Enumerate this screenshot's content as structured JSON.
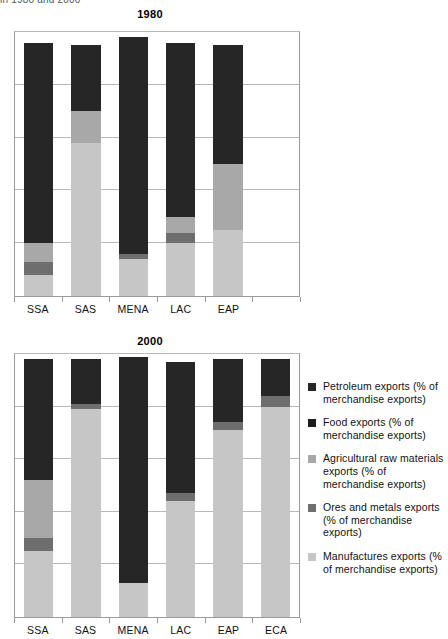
{
  "top_caption": "in 1980 and 2000",
  "colors": {
    "petroleum": "#262626",
    "food": "#1c1c1c",
    "agricultural": "#a8a8a8",
    "ores": "#6e6e6e",
    "manufactures": "#c6c6c6",
    "gridline": "#b8b8b8",
    "axis": "#9a9a9a"
  },
  "legend": {
    "items": [
      {
        "key": "petroleum",
        "swatch": "#262626",
        "label": "Petroleum exports (% of merchandise exports)"
      },
      {
        "key": "food",
        "swatch": "#1c1c1c",
        "label": "Food exports (% of merchandise exports)"
      },
      {
        "key": "agricultural",
        "swatch": "#a8a8a8",
        "label": "Agricultural raw materials exports (% of merchandise exports)"
      },
      {
        "key": "ores",
        "swatch": "#6e6e6e",
        "label": "Ores and metals exports (% of merchandise exports)"
      },
      {
        "key": "manufactures",
        "swatch": "#c6c6c6",
        "label": "Manufactures exports (% of merchandise exports)"
      }
    ]
  },
  "charts": [
    {
      "id": "chart-1980",
      "title": "1980"
    },
    {
      "id": "chart-2000",
      "title": "2000"
    }
  ],
  "chart_data": [
    {
      "type": "bar",
      "stacked": true,
      "title": "1980",
      "xlabel": "",
      "ylabel": "",
      "ylim": [
        0,
        100
      ],
      "grid": true,
      "gridlines": [
        20,
        40,
        60,
        80
      ],
      "legend_position": "right",
      "categories": [
        "SSA",
        "SAS",
        "MENA",
        "LAC",
        "EAP",
        ""
      ],
      "series": [
        {
          "name": "Manufactures exports (% of merchandise exports)",
          "values": [
            8,
            58,
            14,
            20,
            25,
            null
          ]
        },
        {
          "name": "Ores and metals exports (% of merchandise exports)",
          "values": [
            5,
            0,
            2,
            4,
            0,
            null
          ]
        },
        {
          "name": "Agricultural raw materials exports (% of merchandise exports)",
          "values": [
            7,
            12,
            0,
            6,
            25,
            null
          ]
        },
        {
          "name": "Food exports (% of merchandise exports)",
          "values": [
            0,
            0,
            0,
            0,
            0,
            null
          ]
        },
        {
          "name": "Petroleum exports (% of merchandise exports)",
          "values": [
            76,
            25,
            82,
            66,
            45,
            null
          ]
        }
      ]
    },
    {
      "type": "bar",
      "stacked": true,
      "title": "2000",
      "xlabel": "",
      "ylabel": "",
      "ylim": [
        0,
        100
      ],
      "grid": true,
      "gridlines": [
        20,
        40,
        60,
        80
      ],
      "legend_position": "right",
      "categories": [
        "SSA",
        "SAS",
        "MENA",
        "LAC",
        "EAP",
        "ECA"
      ],
      "series": [
        {
          "name": "Manufactures exports (% of merchandise exports)",
          "values": [
            25,
            79,
            13,
            44,
            71,
            80
          ]
        },
        {
          "name": "Ores and metals exports (% of merchandise exports)",
          "values": [
            5,
            2,
            0,
            3,
            3,
            4
          ]
        },
        {
          "name": "Agricultural raw materials exports (% of merchandise exports)",
          "values": [
            22,
            0,
            0,
            0,
            0,
            0
          ]
        },
        {
          "name": "Food exports (% of merchandise exports)",
          "values": [
            0,
            0,
            0,
            0,
            0,
            0
          ]
        },
        {
          "name": "Petroleum exports (% of merchandise exports)",
          "values": [
            46,
            17,
            86,
            50,
            24,
            14
          ]
        }
      ]
    }
  ]
}
